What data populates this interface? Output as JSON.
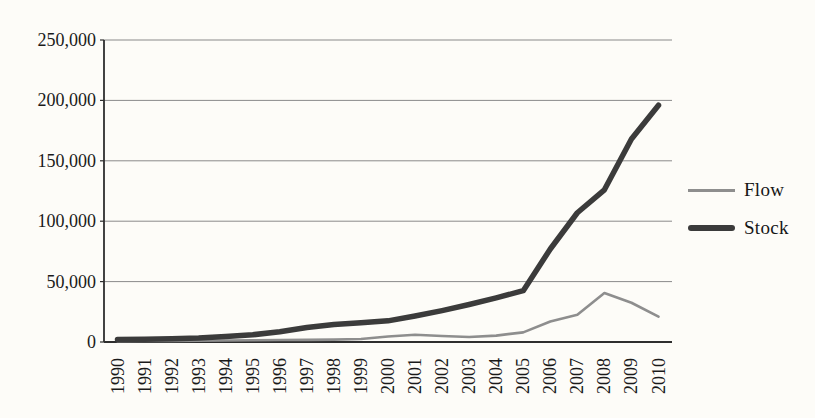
{
  "chart_data": {
    "type": "line",
    "title": "",
    "xlabel": "",
    "ylabel": "",
    "categories": [
      "1990",
      "1991",
      "1992",
      "1993",
      "1994",
      "1995",
      "1996",
      "1997",
      "1998",
      "1999",
      "2000",
      "2001",
      "2002",
      "2003",
      "2004",
      "2005",
      "2006",
      "2007",
      "2008",
      "2009",
      "2010"
    ],
    "series": [
      {
        "name": "Flow",
        "color": "#8e8e8e",
        "stroke_width": 2.6,
        "values": [
          700,
          800,
          900,
          1000,
          1200,
          1400,
          1600,
          1800,
          2000,
          2500,
          4500,
          6000,
          5000,
          4200,
          5300,
          8000,
          17000,
          22500,
          40500,
          32500,
          21000
        ]
      },
      {
        "name": "Stock",
        "color": "#3b3b3b",
        "stroke_width": 5.5,
        "values": [
          2000,
          2300,
          2700,
          3300,
          4500,
          6000,
          8500,
          12000,
          14500,
          16000,
          17500,
          21500,
          26000,
          31000,
          36500,
          42500,
          77000,
          107000,
          126000,
          168000,
          196000
        ]
      }
    ],
    "ylim": [
      0,
      250000
    ],
    "yticks": [
      0,
      50000,
      100000,
      150000,
      200000,
      250000
    ],
    "ytick_labels": [
      "0",
      "50,000",
      "100,000",
      "150,000",
      "200,000",
      "250,000"
    ],
    "grid": "horizontal",
    "legend": [
      "Flow",
      "Stock"
    ],
    "legend_position": "right",
    "x_labels_rotated_degrees": 90
  },
  "colors": {
    "background": "#fdfcf8",
    "gridline": "#8a8a8a",
    "axis": "#2e2e2e",
    "text": "#1a1a1a"
  }
}
